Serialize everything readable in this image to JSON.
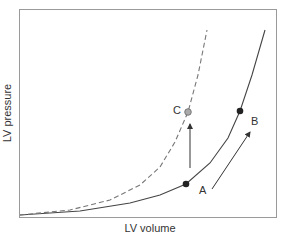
{
  "chart_data": {
    "type": "line",
    "title": "",
    "xlabel": "LV volume",
    "ylabel": "LV pressure",
    "grid": false,
    "legend": null,
    "axes_ticks": "none",
    "series": [
      {
        "name": "Normal compliance (solid)",
        "style": "solid",
        "color": "#444444",
        "points_px": [
          [
            20,
            215
          ],
          [
            80,
            211
          ],
          [
            130,
            203
          ],
          [
            160,
            195
          ],
          [
            186,
            184
          ],
          [
            210,
            163
          ],
          [
            228,
            138
          ],
          [
            240,
            111
          ],
          [
            252,
            75
          ],
          [
            265,
            30
          ]
        ]
      },
      {
        "name": "Decreased compliance (dashed)",
        "style": "dashed",
        "color": "#777777",
        "points_px": [
          [
            20,
            215
          ],
          [
            70,
            210
          ],
          [
            110,
            200
          ],
          [
            140,
            185
          ],
          [
            160,
            167
          ],
          [
            175,
            142
          ],
          [
            188,
            112
          ],
          [
            198,
            75
          ],
          [
            207,
            30
          ]
        ]
      }
    ],
    "annotations": [
      {
        "label": "A",
        "marker": "black-dot",
        "on_series": "solid",
        "position": "lower point"
      },
      {
        "label": "B",
        "marker": "black-dot",
        "on_series": "solid",
        "position": "upper point"
      },
      {
        "label": "C",
        "marker": "gray-dot",
        "on_series": "dashed",
        "position": "same volume as A, higher pressure"
      },
      {
        "type": "arrow",
        "from": "A",
        "to": "B",
        "meaning": "increased volume along same curve"
      },
      {
        "type": "arrow",
        "from": "A",
        "to": "C",
        "meaning": "increased pressure at same volume (vertical)"
      }
    ]
  },
  "labels": {
    "x_axis": "LV volume",
    "y_axis": "LV pressure",
    "point_a": "A",
    "point_b": "B",
    "point_c": "C"
  }
}
